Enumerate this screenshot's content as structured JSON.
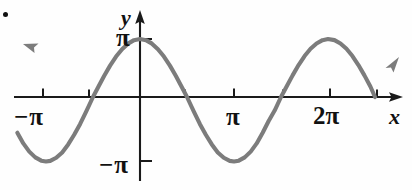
{
  "figure": {
    "title": "",
    "corner_marker": "bullet-dot"
  },
  "labels": {
    "x_axis_name": "x",
    "y_axis_name": "y",
    "x_neg_pi": "−π",
    "x_pi": "π",
    "x_2pi": "2π",
    "y_pi": "π",
    "y_neg_pi": "−π"
  },
  "colors": {
    "curve": "#7c7c7c",
    "axis": "#1a1a1a",
    "text": "#111111",
    "background": "#ffffff"
  },
  "chart_data": {
    "type": "line",
    "title": "",
    "xlabel": "x",
    "ylabel": "y",
    "function": "y = -π cos(x)",
    "amplitude": 3.14159,
    "period": 6.28319,
    "grid": false,
    "legend": null,
    "xlim": [
      -4.1,
      5.6
    ],
    "ylim": [
      -3.6,
      3.6
    ],
    "xticks": [
      -3.14159,
      0,
      3.14159,
      6.28319
    ],
    "xticklabels": [
      "−π",
      "",
      "π",
      "2π"
    ],
    "yticks": [
      3.14159,
      -3.14159
    ],
    "yticklabels": [
      "π",
      "−π"
    ],
    "key_points": {
      "maxima": [
        {
          "x": -3.14159,
          "y": 3.14159
        },
        {
          "x": 3.14159,
          "y": 3.14159
        }
      ],
      "minima": [
        {
          "x": 0,
          "y": -3.14159
        },
        {
          "x": 6.28319,
          "y": -3.14159
        }
      ],
      "zeros": [
        -4.71239,
        -1.5708,
        1.5708,
        4.71239,
        7.85398
      ]
    },
    "x": [
      -4.1,
      -3.9,
      -3.7,
      -3.5,
      -3.3,
      -3.14159,
      -3.0,
      -2.8,
      -2.6,
      -2.4,
      -2.2,
      -2.0,
      -1.8,
      -1.5708,
      -1.4,
      -1.2,
      -1.0,
      -0.8,
      -0.6,
      -0.4,
      -0.2,
      0.0,
      0.2,
      0.4,
      0.6,
      0.8,
      1.0,
      1.2,
      1.4,
      1.5708,
      1.8,
      2.0,
      2.2,
      2.4,
      2.6,
      2.8,
      3.0,
      3.14159,
      3.3,
      3.5,
      3.7,
      3.9,
      4.1,
      4.3,
      4.5,
      4.71239,
      4.9,
      5.1,
      5.3,
      5.5,
      5.7,
      5.9,
      6.1,
      6.28319,
      6.5,
      6.7,
      6.9,
      7.1,
      7.3,
      7.5,
      7.7,
      7.85398
    ],
    "y": [
      -1.74,
      -2.26,
      -2.66,
      -2.94,
      -3.1,
      -3.14159,
      -3.11,
      -2.96,
      -2.7,
      -2.31,
      -1.84,
      -1.31,
      -0.71,
      0.0,
      0.53,
      1.14,
      1.7,
      2.19,
      2.59,
      2.89,
      3.08,
      3.14159,
      3.08,
      2.89,
      2.59,
      2.19,
      1.7,
      1.14,
      0.53,
      0.0,
      -0.71,
      -1.31,
      -1.84,
      -2.31,
      -2.7,
      -2.96,
      -3.11,
      -3.14159,
      -3.1,
      -2.94,
      -2.66,
      -2.26,
      -1.74,
      -1.17,
      -0.66,
      0.0,
      0.57,
      1.17,
      1.73,
      2.22,
      2.61,
      2.9,
      3.08,
      3.14159,
      3.08,
      2.9,
      2.61,
      2.22,
      1.73,
      1.17,
      0.57,
      0.0
    ]
  }
}
